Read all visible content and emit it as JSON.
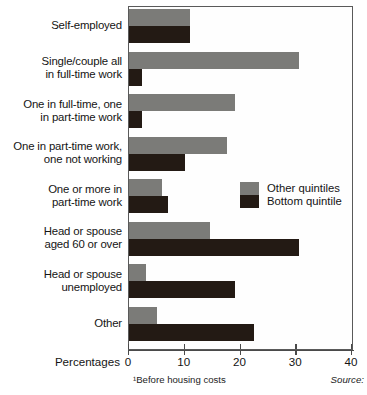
{
  "chart_data": {
    "type": "bar",
    "orientation": "horizontal",
    "title": "",
    "xlabel": "Percentages",
    "ylabel": "",
    "xlim": [
      0,
      40
    ],
    "xticks": [
      0,
      10,
      20,
      30,
      40
    ],
    "xtick_labels": [
      "0",
      "10",
      "20",
      "30",
      "40"
    ],
    "grid": false,
    "legend_position": "middle-right-inside",
    "categories": [
      "Self-employed",
      "Single/couple all in full-time work",
      "One in full-time, one in part-time work",
      "One in part-time work, one not working",
      "One or more in part-time work",
      "Head or spouse aged 60 or over",
      "Head or spouse unemployed",
      "Other"
    ],
    "series": [
      {
        "name": "Other quintiles",
        "color": "#7b7b78",
        "values": [
          11.0,
          30.5,
          19.0,
          17.5,
          6.0,
          14.5,
          3.0,
          5.0
        ]
      },
      {
        "name": "Bottom quintile",
        "color": "#231a14",
        "values": [
          11.0,
          2.3,
          2.3,
          10.0,
          7.0,
          30.5,
          19.0,
          22.5
        ]
      }
    ],
    "footnote": "¹Before housing costs",
    "source_label": "Source:"
  },
  "categories_display": [
    {
      "lines": [
        "Self-employed"
      ]
    },
    {
      "lines": [
        "Single/couple all",
        "in full-time work"
      ]
    },
    {
      "lines": [
        "One in full-time, one",
        "in part-time work"
      ]
    },
    {
      "lines": [
        "One in part-time work,",
        "one not working"
      ]
    },
    {
      "lines": [
        "One or more in",
        "part-time work"
      ]
    },
    {
      "lines": [
        "Head or spouse",
        "aged 60 or over"
      ]
    },
    {
      "lines": [
        "Head or spouse",
        "unemployed"
      ]
    },
    {
      "lines": [
        "Other"
      ]
    }
  ],
  "legend": {
    "items": [
      {
        "label": "Other quintiles",
        "color": "#7b7b78"
      },
      {
        "label": "Bottom quintile",
        "color": "#231a14"
      }
    ]
  }
}
